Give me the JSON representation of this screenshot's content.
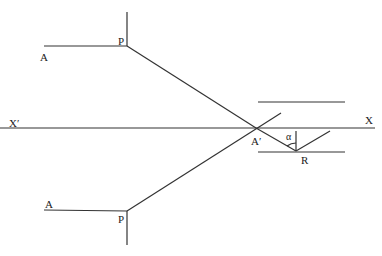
{
  "diagram": {
    "labels": {
      "A_upper": "A",
      "P_upper": "P",
      "X_prime": "X′",
      "X": "X",
      "A_prime": "A′",
      "alpha": "α",
      "R": "R",
      "A_lower": "A",
      "P_lower": "P"
    },
    "line_color": "#333333"
  }
}
